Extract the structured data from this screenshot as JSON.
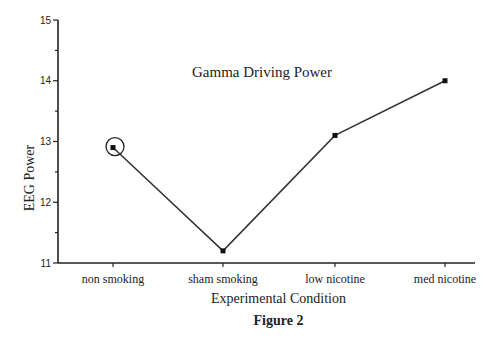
{
  "chart_data": {
    "type": "line",
    "title": "Gamma Driving Power",
    "xlabel": "Experimental Condition",
    "ylabel": "EEG Power",
    "categories": [
      "non smoking",
      "sham smoking",
      "low nicotine",
      "med nicotine"
    ],
    "series": [
      {
        "name": "Gamma Driving Power",
        "values": [
          12.9,
          11.2,
          13.1,
          14.0
        ]
      }
    ],
    "ylim": [
      11,
      15
    ],
    "yticks": [
      "11",
      "12",
      "13",
      "14",
      "15"
    ],
    "grid": false,
    "legend": "none",
    "annotations": [
      {
        "type": "circle",
        "target": "non smoking",
        "value": 12.9
      }
    ]
  },
  "figure_caption": "Figure 2",
  "colors": {
    "line": "#333333",
    "marker": "#111111",
    "axis": "#222222"
  }
}
